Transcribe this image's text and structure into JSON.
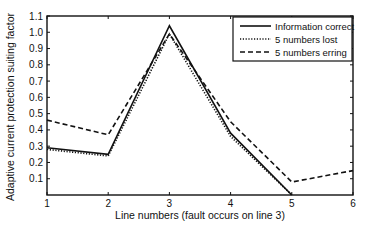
{
  "chart_data": {
    "type": "line",
    "title": "",
    "xlabel": "Line numbers (fault occurs on line 3)",
    "ylabel": "Adaptive current protection suiting factor",
    "x": [
      1,
      2,
      3,
      4,
      5,
      6
    ],
    "xlim": [
      1,
      6
    ],
    "ylim": [
      0,
      1.1
    ],
    "xticks": [
      "1",
      "2",
      "3",
      "4",
      "5",
      "6"
    ],
    "yticks": [
      "0.1",
      "0.2",
      "0.3",
      "0.4",
      "0.5",
      "0.6",
      "0.7",
      "0.8",
      "0.9",
      "1.0",
      "1.1"
    ],
    "grid": false,
    "legend_position": "upper right",
    "series": [
      {
        "name": "Information correct",
        "style": "solid",
        "x": [
          1,
          2,
          3,
          4,
          5
        ],
        "values": [
          0.29,
          0.25,
          1.04,
          0.38,
          0.0
        ]
      },
      {
        "name": "5 numbers lost",
        "style": "dotted",
        "x": [
          1,
          2,
          3,
          4,
          5
        ],
        "values": [
          0.28,
          0.24,
          0.99,
          0.36,
          0.0
        ]
      },
      {
        "name": "5 numbers erring",
        "style": "dashed",
        "x": [
          1,
          2,
          3,
          4,
          5,
          6
        ],
        "values": [
          0.46,
          0.37,
          0.99,
          0.45,
          0.08,
          0.15
        ]
      }
    ]
  },
  "colors": {
    "line": "#111111",
    "background": "#ffffff"
  }
}
